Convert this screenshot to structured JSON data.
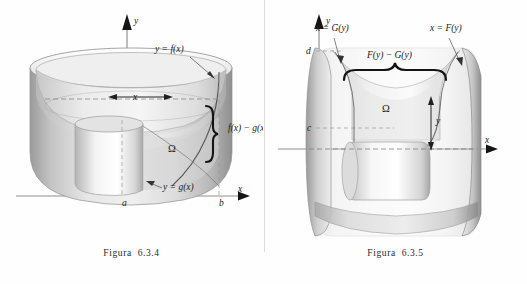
{
  "page": {
    "background_color": "#fefefe",
    "ink_color": "#222222",
    "divider_color": "#d8d8d8"
  },
  "figures": [
    {
      "id": "figura-6-3-4",
      "caption": "Figura  6.3.4",
      "description": "Solido di rotazione generato ruotando la regione Omega attorno all asse y, regione compresa fra y = f(x) e y = g(x) per x tra a e b",
      "axes": {
        "y_axis_label": "y",
        "x_axis_label": "x"
      },
      "labels": [
        {
          "name": "upper-curve-label",
          "text": "y = f(x)",
          "x": 155,
          "y": 52
        },
        {
          "name": "lower-curve-label",
          "text": "y = g(x)",
          "x": 163,
          "y": 190
        },
        {
          "name": "region-label",
          "text": "Ω",
          "x": 168,
          "y": 152
        },
        {
          "name": "radius-label",
          "text": "x",
          "x": 133,
          "y": 100
        },
        {
          "name": "height-label",
          "text": "f(x) − g(x)",
          "x": 228,
          "y": 131
        },
        {
          "name": "tick-label-a",
          "text": "a",
          "x": 122,
          "y": 206
        },
        {
          "name": "tick-label-b",
          "text": "b",
          "x": 219,
          "y": 206
        }
      ],
      "colors": {
        "surface_light": "#f2f2f2",
        "surface_mid": "#d5d5d5",
        "surface_dark": "#a9a9a9",
        "surface_shadow": "#8d8d8d",
        "rim_highlight": "#fafafa"
      }
    },
    {
      "id": "figura-6-3-5",
      "caption": "Figura  6.3.5",
      "description": "Solido di rotazione generato ruotando la regione Omega attorno all asse x, regione compresa fra x = G(y) e x = F(y) per y tra c e d",
      "axes": {
        "y_axis_label": "y",
        "x_axis_label": "x"
      },
      "labels": [
        {
          "name": "left-curve-label",
          "text": "x = G(y)",
          "x": 52,
          "y": 31
        },
        {
          "name": "right-curve-label",
          "text": "x = F(y)",
          "x": 166,
          "y": 31
        },
        {
          "name": "width-label",
          "text": "F(y) − G(y)",
          "x": 125,
          "y": 58
        },
        {
          "name": "region-label",
          "text": "Ω",
          "x": 118,
          "y": 112
        },
        {
          "name": "radius-label",
          "text": "y",
          "x": 172,
          "y": 120
        },
        {
          "name": "tick-label-d",
          "text": "d",
          "x": 42,
          "y": 51
        },
        {
          "name": "tick-label-c",
          "text": "c",
          "x": 43,
          "y": 128
        }
      ],
      "colors": {
        "surface_light": "#f2f2f2",
        "surface_mid": "#d5d5d5",
        "surface_dark": "#a9a9a9",
        "surface_shadow": "#8d8d8d",
        "rim_highlight": "#fafafa"
      }
    }
  ]
}
